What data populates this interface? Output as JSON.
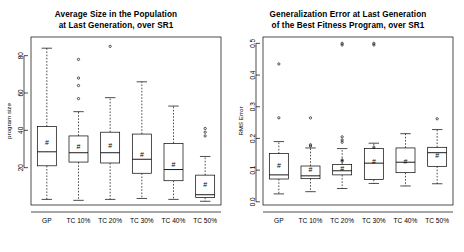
{
  "figure": {
    "type": "boxplot-pair",
    "background": "#ffffff",
    "foreground": "#000000",
    "mean_marker_glyph": "#"
  },
  "panels": [
    {
      "id": "left",
      "title_line1": "Average Size in the Population",
      "title_line2": "at Last Generation, over SR1",
      "ylabel": "program size",
      "xlabel": "",
      "y_ticks": [
        "20",
        "40",
        "60",
        "80"
      ],
      "y_tick_values": [
        20,
        40,
        60,
        80
      ],
      "ylim": [
        0,
        90
      ],
      "categories": [
        "GP",
        "TC 10%",
        "TC 20%",
        "TC 30%",
        "TC 40%",
        "TC 50%"
      ]
    },
    {
      "id": "right",
      "title_line1": "Generalization Error at Last Generation",
      "title_line2": "of the Best Fitness Program, over SR1",
      "ylabel": "RMS Error",
      "xlabel": "",
      "y_ticks": [
        "0.0",
        "0.1",
        "0.2",
        "0.3",
        "0.4",
        "0.5"
      ],
      "y_tick_values": [
        0.0,
        0.1,
        0.2,
        0.3,
        0.4,
        0.5
      ],
      "ylim": [
        -0.01,
        0.52
      ],
      "categories": [
        "GP",
        "TC 10%",
        "TC 20%",
        "TC 30%",
        "TC 40%",
        "TC 50%"
      ]
    }
  ],
  "chart_data": [
    {
      "type": "boxplot",
      "title": "Average Size in the Population at Last Generation, over SR1",
      "xlabel": "",
      "ylabel": "program size",
      "ylim": [
        0,
        90
      ],
      "yticks": [
        20,
        40,
        60,
        80
      ],
      "grid": false,
      "legend": "none",
      "categories": [
        "GP",
        "TC 10%",
        "TC 20%",
        "TC 30%",
        "TC 40%",
        "TC 50%"
      ],
      "boxes": [
        {
          "label": "GP",
          "min": 3.0,
          "q1": 21.0,
          "median": 28.5,
          "q3": 42.0,
          "max": 84.0,
          "mean": 33.5,
          "outliers": []
        },
        {
          "label": "TC 10%",
          "min": 2.5,
          "q1": 23.0,
          "median": 28.0,
          "q3": 37.0,
          "max": 50.0,
          "mean": 31.5,
          "outliers": [
            78.0,
            68.0,
            64.0,
            57.0
          ]
        },
        {
          "label": "TC 20%",
          "min": 3.0,
          "q1": 22.5,
          "median": 28.0,
          "q3": 39.0,
          "max": 57.5,
          "mean": 32.0,
          "outliers": [
            85.0
          ]
        },
        {
          "label": "TC 30%",
          "min": 3.5,
          "q1": 17.0,
          "median": 24.5,
          "q3": 38.0,
          "max": 66.0,
          "mean": 27.0,
          "outliers": []
        },
        {
          "label": "TC 40%",
          "min": 3.0,
          "q1": 13.0,
          "median": 19.0,
          "q3": 33.0,
          "max": 53.0,
          "mean": 21.5,
          "outliers": []
        },
        {
          "label": "TC 50%",
          "min": 2.0,
          "q1": 4.0,
          "median": 5.5,
          "q3": 16.0,
          "max": 26.0,
          "mean": 11.0,
          "outliers": [
            41.0,
            39.0,
            37.0
          ]
        }
      ]
    },
    {
      "type": "boxplot",
      "title": "Generalization Error at Last Generation of the Best Fitness Program, over SR1",
      "xlabel": "",
      "ylabel": "RMS Error",
      "ylim": [
        -0.01,
        0.52
      ],
      "yticks": [
        0.0,
        0.1,
        0.2,
        0.3,
        0.4,
        0.5
      ],
      "grid": false,
      "legend": "none",
      "categories": [
        "GP",
        "TC 10%",
        "TC 20%",
        "TC 30%",
        "TC 40%",
        "TC 50%"
      ],
      "boxes": [
        {
          "label": "GP",
          "min": 0.025,
          "q1": 0.072,
          "median": 0.085,
          "q3": 0.152,
          "max": 0.19,
          "mean": 0.115,
          "outliers": [
            0.435,
            0.265
          ]
        },
        {
          "label": "TC 10%",
          "min": 0.032,
          "q1": 0.073,
          "median": 0.082,
          "q3": 0.113,
          "max": 0.17,
          "mean": 0.103,
          "outliers": [
            0.265,
            0.18,
            0.176
          ]
        },
        {
          "label": "TC 20%",
          "min": 0.042,
          "q1": 0.085,
          "median": 0.098,
          "q3": 0.118,
          "max": 0.168,
          "mean": 0.105,
          "outliers": [
            0.5,
            0.495,
            0.205,
            0.195,
            0.188,
            0.132,
            0.128
          ]
        },
        {
          "label": "TC 30%",
          "min": 0.058,
          "q1": 0.07,
          "median": 0.122,
          "q3": 0.168,
          "max": 0.185,
          "mean": 0.127,
          "outliers": [
            0.5,
            0.495,
            0.172
          ]
        },
        {
          "label": "TC 40%",
          "min": 0.05,
          "q1": 0.092,
          "median": 0.125,
          "q3": 0.17,
          "max": 0.215,
          "mean": 0.128,
          "outliers": []
        },
        {
          "label": "TC 50%",
          "min": 0.057,
          "q1": 0.112,
          "median": 0.155,
          "q3": 0.172,
          "max": 0.228,
          "mean": 0.147,
          "outliers": [
            0.262
          ]
        }
      ]
    }
  ]
}
